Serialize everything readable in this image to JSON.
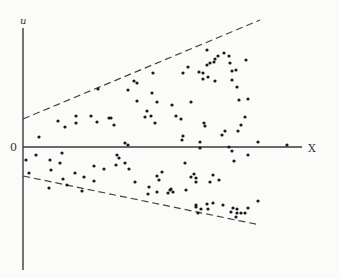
{
  "diagram": {
    "title": "",
    "labels": {
      "y_axis": "u",
      "x_axis": "X",
      "origin": "0"
    },
    "colors": {
      "background": "#fbfbfa",
      "axis": "#3a3a3a",
      "dashed_bounds": "#444444",
      "points": "#1a1a1a"
    },
    "axes": {
      "y_axis": {
        "x": 23,
        "y_top": 28,
        "y_bottom": 270
      },
      "x_axis": {
        "y": 147,
        "x_left": 23,
        "x_right": 302
      }
    },
    "bounds": {
      "upper": {
        "x1": 23,
        "y1": 119,
        "x2": 260,
        "y2": 20,
        "style": "dashed"
      },
      "lower": {
        "x1": 23,
        "y1": 176,
        "x2": 260,
        "y2": 225,
        "style": "dashed"
      }
    },
    "points": [
      [
        39,
        137
      ],
      [
        58,
        121
      ],
      [
        65,
        127
      ],
      [
        76,
        123
      ],
      [
        76,
        116
      ],
      [
        91,
        116
      ],
      [
        97,
        122
      ],
      [
        98,
        89
      ],
      [
        109,
        118
      ],
      [
        111,
        118
      ],
      [
        114,
        125
      ],
      [
        125,
        143
      ],
      [
        128,
        145
      ],
      [
        128,
        90
      ],
      [
        145,
        117
      ],
      [
        153,
        73
      ],
      [
        152,
        93
      ],
      [
        134,
        81
      ],
      [
        137,
        83
      ],
      [
        137,
        101
      ],
      [
        147,
        111
      ],
      [
        151,
        116
      ],
      [
        155,
        123
      ],
      [
        157,
        102
      ],
      [
        172,
        105
      ],
      [
        176,
        116
      ],
      [
        181,
        119
      ],
      [
        183,
        73
      ],
      [
        188,
        67
      ],
      [
        191,
        102
      ],
      [
        183,
        136
      ],
      [
        182,
        140
      ],
      [
        200,
        142
      ],
      [
        200,
        148
      ],
      [
        205,
        126
      ],
      [
        207,
        65
      ],
      [
        204,
        123
      ],
      [
        207,
        50
      ],
      [
        199,
        72
      ],
      [
        208,
        77
      ],
      [
        210,
        63
      ],
      [
        214,
        62
      ],
      [
        203,
        73
      ],
      [
        203,
        79
      ],
      [
        215,
        81
      ],
      [
        215,
        59
      ],
      [
        218,
        56
      ],
      [
        224,
        53
      ],
      [
        232,
        71
      ],
      [
        232,
        80
      ],
      [
        237,
        87
      ],
      [
        239,
        100
      ],
      [
        248,
        99
      ],
      [
        241,
        125
      ],
      [
        245,
        117
      ],
      [
        238,
        131
      ],
      [
        222,
        135
      ],
      [
        225,
        131
      ],
      [
        229,
        147
      ],
      [
        258,
        142
      ],
      [
        229,
        56
      ],
      [
        230,
        63
      ],
      [
        236,
        70
      ],
      [
        246,
        60
      ],
      [
        26,
        160
      ],
      [
        36,
        155
      ],
      [
        29,
        173
      ],
      [
        51,
        170
      ],
      [
        50,
        160
      ],
      [
        60,
        163
      ],
      [
        63,
        179
      ],
      [
        62,
        153
      ],
      [
        49,
        188
      ],
      [
        67,
        185
      ],
      [
        75,
        173
      ],
      [
        82,
        191
      ],
      [
        84,
        177
      ],
      [
        94,
        181
      ],
      [
        94,
        166
      ],
      [
        104,
        169
      ],
      [
        117,
        155
      ],
      [
        116,
        165
      ],
      [
        119,
        158
      ],
      [
        125,
        163
      ],
      [
        129,
        169
      ],
      [
        135,
        182
      ],
      [
        149,
        187
      ],
      [
        157,
        176
      ],
      [
        159,
        180
      ],
      [
        162,
        172
      ],
      [
        185,
        163
      ],
      [
        191,
        177
      ],
      [
        194,
        174
      ],
      [
        196,
        182
      ],
      [
        148,
        194
      ],
      [
        157,
        192
      ],
      [
        168,
        193
      ],
      [
        170,
        190
      ],
      [
        171,
        189
      ],
      [
        173,
        192
      ],
      [
        186,
        190
      ],
      [
        196,
        205
      ],
      [
        196,
        207
      ],
      [
        198,
        213
      ],
      [
        201,
        209
      ],
      [
        207,
        204
      ],
      [
        208,
        209
      ],
      [
        213,
        203
      ],
      [
        210,
        182
      ],
      [
        213,
        175
      ],
      [
        232,
        151
      ],
      [
        234,
        161
      ],
      [
        248,
        155
      ],
      [
        219,
        180
      ],
      [
        196,
        178
      ],
      [
        223,
        205
      ],
      [
        233,
        208
      ],
      [
        237,
        209
      ],
      [
        237,
        213
      ],
      [
        236,
        217
      ],
      [
        241,
        213
      ],
      [
        245,
        213
      ],
      [
        248,
        208
      ],
      [
        258,
        201
      ],
      [
        231,
        212
      ],
      [
        287,
        145
      ]
    ]
  }
}
